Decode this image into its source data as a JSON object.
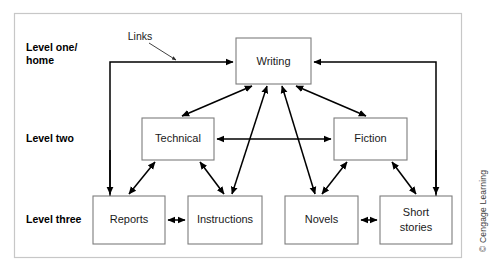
{
  "figure": {
    "credit": "© Cengage Learning",
    "annotation": {
      "label": "Links"
    },
    "levels": [
      {
        "id": "level-one",
        "label_line1": "Level one/",
        "label_line2": "home"
      },
      {
        "id": "level-two",
        "label_line1": "Level two",
        "label_line2": ""
      },
      {
        "id": "level-three",
        "label_line1": "Level three",
        "label_line2": ""
      }
    ],
    "nodes": [
      {
        "id": "writing",
        "label_line1": "Writing",
        "label_line2": "",
        "level": "level-one",
        "x": 236,
        "y": 38,
        "w": 75,
        "h": 46
      },
      {
        "id": "technical",
        "label_line1": "Technical",
        "label_line2": "",
        "level": "level-two",
        "x": 142,
        "y": 118,
        "w": 72,
        "h": 42
      },
      {
        "id": "fiction",
        "label_line1": "Fiction",
        "label_line2": "",
        "level": "level-two",
        "x": 334,
        "y": 118,
        "w": 73,
        "h": 42
      },
      {
        "id": "reports",
        "label_line1": "Reports",
        "label_line2": "",
        "level": "level-three",
        "x": 93,
        "y": 196,
        "w": 72,
        "h": 48
      },
      {
        "id": "instructions",
        "label_line1": "Instructions",
        "label_line2": "",
        "level": "level-three",
        "x": 188,
        "y": 196,
        "w": 74,
        "h": 48
      },
      {
        "id": "novels",
        "label_line1": "Novels",
        "label_line2": "",
        "level": "level-three",
        "x": 285,
        "y": 196,
        "w": 73,
        "h": 48
      },
      {
        "id": "shortstories",
        "label_line1": "Short",
        "label_line2": "stories",
        "level": "level-three",
        "x": 380,
        "y": 196,
        "w": 72,
        "h": 48
      }
    ],
    "connections": [
      {
        "id": "reports-to-writing",
        "from": "reports",
        "to": "writing",
        "style": "elbow-left",
        "heads": "one"
      },
      {
        "id": "shortstories-to-writing",
        "from": "shortstories",
        "to": "writing",
        "style": "elbow-right",
        "heads": "one"
      },
      {
        "id": "writing-technical",
        "from": "writing",
        "to": "technical",
        "style": "diagonal",
        "heads": "two"
      },
      {
        "id": "writing-fiction",
        "from": "writing",
        "to": "fiction",
        "style": "diagonal",
        "heads": "two"
      },
      {
        "id": "writing-instructions",
        "from": "writing",
        "to": "instructions",
        "style": "diagonal",
        "heads": "two"
      },
      {
        "id": "writing-novels",
        "from": "writing",
        "to": "novels",
        "style": "diagonal",
        "heads": "two"
      },
      {
        "id": "technical-fiction",
        "from": "technical",
        "to": "fiction",
        "style": "horizontal",
        "heads": "two"
      },
      {
        "id": "technical-reports",
        "from": "technical",
        "to": "reports",
        "style": "diagonal",
        "heads": "two"
      },
      {
        "id": "technical-instructions",
        "from": "technical",
        "to": "instructions",
        "style": "diagonal",
        "heads": "two"
      },
      {
        "id": "fiction-novels",
        "from": "fiction",
        "to": "novels",
        "style": "diagonal",
        "heads": "two"
      },
      {
        "id": "fiction-shortstories",
        "from": "fiction",
        "to": "shortstories",
        "style": "diagonal",
        "heads": "two"
      },
      {
        "id": "reports-instructions",
        "from": "reports",
        "to": "instructions",
        "style": "horizontal",
        "heads": "two"
      },
      {
        "id": "novels-shortstories",
        "from": "novels",
        "to": "shortstories",
        "style": "horizontal",
        "heads": "two"
      }
    ],
    "colors": {
      "frame_border": "#c7c7c7",
      "box_border": "#7d7d7d",
      "line": "#000000",
      "text": "#1a1a1a",
      "background": "#ffffff"
    }
  }
}
